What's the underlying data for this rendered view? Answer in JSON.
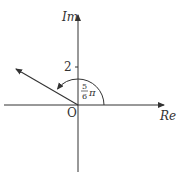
{
  "diagram": {
    "type": "complex-plane",
    "axes": {
      "x_label": "Re",
      "y_label": "Im",
      "origin_label": "O"
    },
    "ticks": [
      {
        "axis": "Im",
        "value": "2"
      }
    ],
    "vector": {
      "direction": "upper-left",
      "angle_label_num": "5",
      "angle_label_den": "6",
      "angle_label_sym": "π"
    },
    "colors": {
      "stroke": "#333333",
      "background": "#ffffff"
    }
  }
}
